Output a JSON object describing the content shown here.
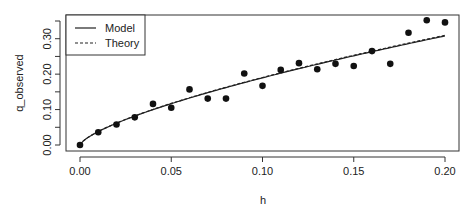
{
  "chart_data": {
    "type": "scatter",
    "title": "",
    "xlabel": "h",
    "ylabel": "q_observed",
    "xlim": [
      0.0,
      0.2
    ],
    "ylim": [
      0.0,
      0.35
    ],
    "x_ticks": [
      0.0,
      0.05,
      0.1,
      0.15,
      0.2
    ],
    "x_tick_labels": [
      "0.00",
      "0.05",
      "0.10",
      "0.15",
      "0.20"
    ],
    "y_ticks": [
      0.0,
      0.05,
      0.1,
      0.15,
      0.2,
      0.25,
      0.3,
      0.35
    ],
    "y_tick_labels": [
      "0.00",
      "",
      "0.10",
      "",
      "0.20",
      "",
      "0.30",
      ""
    ],
    "grid": false,
    "legend_position": "topleft",
    "series": [
      {
        "name": "observed",
        "kind": "points",
        "x": [
          0.0,
          0.01,
          0.02,
          0.03,
          0.04,
          0.05,
          0.06,
          0.07,
          0.08,
          0.09,
          0.1,
          0.11,
          0.12,
          0.13,
          0.14,
          0.15,
          0.16,
          0.17,
          0.18,
          0.19,
          0.2
        ],
        "y": [
          0.0,
          0.036,
          0.058,
          0.078,
          0.116,
          0.105,
          0.157,
          0.131,
          0.131,
          0.202,
          0.167,
          0.212,
          0.231,
          0.214,
          0.229,
          0.223,
          0.265,
          0.229,
          0.317,
          0.352,
          0.346
        ]
      },
      {
        "name": "Model",
        "kind": "line",
        "linestyle": "solid",
        "formula": "q = 0.95 * h^0.70",
        "coef": 0.95,
        "exponent": 0.7
      },
      {
        "name": "Theory",
        "kind": "line",
        "linestyle": "dashed",
        "formula": "q = 0.955 * h^0.70",
        "coef": 0.955,
        "exponent": 0.7
      }
    ],
    "legend": [
      "Model",
      "Theory"
    ]
  },
  "colors": {
    "axis": "#333333",
    "points": "#111111",
    "lines": "#222222"
  }
}
